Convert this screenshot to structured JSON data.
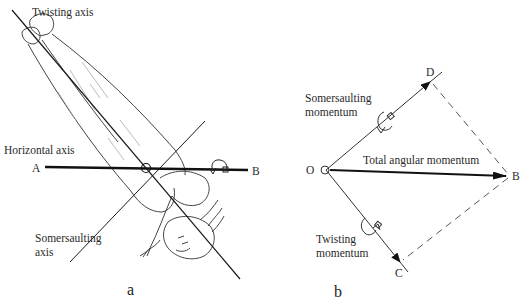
{
  "figure_a": {
    "panel_label": "a",
    "twisting_axis_label": "Twisting axis",
    "horizontal_axis_label": "Horizontal axis",
    "point_a": "A",
    "point_b": "B",
    "somersaulting_axis_label_line1": "Somersaulting",
    "somersaulting_axis_label_line2": "axis"
  },
  "figure_b": {
    "panel_label": "b",
    "origin": "O",
    "point_b": "B",
    "point_c": "C",
    "point_d": "D",
    "somersaulting_momentum_line1": "Somersaulting",
    "somersaulting_momentum_line2": "momentum",
    "total_label": "Total angular momentum",
    "twisting_momentum_line1": "Twisting",
    "twisting_momentum_line2": "momentum"
  },
  "colors": {
    "line": "#1a1a1a",
    "sketch": "#555555",
    "shade": "#aaaaaa",
    "background": "#ffffff"
  }
}
